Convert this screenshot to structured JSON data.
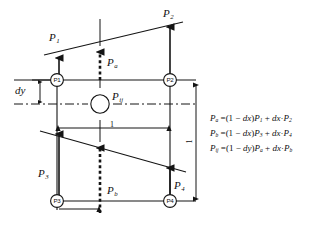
{
  "figure": {
    "stroke_color": "#141414",
    "background": "#ffffff"
  },
  "nodes": [
    {
      "id": "p1",
      "label": "P1",
      "x": 57,
      "y": 80
    },
    {
      "id": "p2",
      "label": "P2",
      "x": 170,
      "y": 80
    },
    {
      "id": "p3",
      "label": "P3",
      "x": 57,
      "y": 201
    },
    {
      "id": "p4",
      "label": "P4",
      "x": 170,
      "y": 201
    }
  ],
  "center_node": {
    "id": "pij",
    "label": "",
    "x": 100,
    "y": 104
  },
  "vector_labels": {
    "p1": "P",
    "p1_sub": "1",
    "p2": "P",
    "p2_sub": "2",
    "p3": "P",
    "p3_sub": "3",
    "p4": "P",
    "p4_sub": "4",
    "pa": "P",
    "pa_sub": "a",
    "pb": "P",
    "pb_sub": "b",
    "pij": "P",
    "pij_sub": "ij"
  },
  "dimensions": {
    "dy_label": "dy",
    "horizontal_span": "1",
    "vertical_span": "1"
  },
  "equations": [
    {
      "id": "eq-pa",
      "lhs": "P",
      "lhs_sub": "a",
      "text": "P a = (1 − dx)P 1 + dx · P 2",
      "parts": {
        "eq": "=",
        "open": "(1 − ",
        "dx1": "dx",
        "close": ")",
        "term1": "P",
        "term1_sub": "1",
        "plus": "+",
        "dx2": "dx",
        "dot": "·",
        "term2": "P",
        "term2_sub": "2"
      }
    },
    {
      "id": "eq-pb",
      "lhs": "P",
      "lhs_sub": "b",
      "text": "P b = (1 − dx)P 3 + dx · P 4",
      "parts": {
        "eq": "=",
        "open": "(1 − ",
        "dx1": "dx",
        "close": ")",
        "term1": "P",
        "term1_sub": "3",
        "plus": "+",
        "dx2": "dx",
        "dot": "·",
        "term2": "P",
        "term2_sub": "4"
      }
    },
    {
      "id": "eq-pij",
      "lhs": "P",
      "lhs_sub": "ij",
      "text": "P ij = (1 − dy)P a + dx · P b",
      "parts": {
        "eq": "=",
        "open": "(1 − ",
        "dx1": "dy",
        "close": ")",
        "term1": "P",
        "term1_sub": "a",
        "plus": "+",
        "dx2": "dx",
        "dot": "·",
        "term2": "P",
        "term2_sub": "b"
      }
    }
  ]
}
